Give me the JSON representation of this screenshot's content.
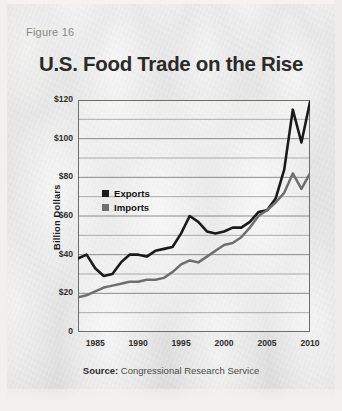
{
  "figure_label": "Figure 16",
  "title": "U.S. Food Trade on the Rise",
  "source": {
    "prefix": "Source:",
    "text": "Congressional Research Service"
  },
  "legend": {
    "items": [
      {
        "label": "Exports",
        "color": "#1a1a1a"
      },
      {
        "label": "Imports",
        "color": "#6e6e6e"
      }
    ]
  },
  "chart_data": {
    "type": "line",
    "title": "U.S. Food Trade on the Rise",
    "xlabel": "",
    "ylabel": "Billion Dollars",
    "xlim": [
      1983,
      2010
    ],
    "ylim": [
      0,
      120
    ],
    "ytick_labels": [
      "0",
      "$20",
      "$40",
      "$60",
      "$80",
      "$100",
      "$120"
    ],
    "yticks": [
      0,
      20,
      40,
      60,
      80,
      100,
      120
    ],
    "minor_ytick_step": 10,
    "xticks": [
      1985,
      1990,
      1995,
      2000,
      2005,
      2010
    ],
    "xtick_labels": [
      "1985",
      "1990",
      "1995",
      "2000",
      "2005",
      "2010"
    ],
    "grid": "horizontal",
    "legend_position": "inside-upper-left",
    "x": [
      1983,
      1984,
      1985,
      1986,
      1987,
      1988,
      1989,
      1990,
      1991,
      1992,
      1993,
      1994,
      1995,
      1996,
      1997,
      1998,
      1999,
      2000,
      2001,
      2002,
      2003,
      2004,
      2005,
      2006,
      2007,
      2008,
      2009,
      2010
    ],
    "series": [
      {
        "name": "Exports",
        "color": "#1a1a1a",
        "values": [
          38,
          40,
          33,
          29,
          30,
          36,
          40,
          40,
          39,
          42,
          43,
          44,
          51,
          60,
          57,
          52,
          51,
          52,
          54,
          54,
          57,
          62,
          63,
          69,
          84,
          115,
          98,
          119
        ]
      },
      {
        "name": "Imports",
        "color": "#6e6e6e",
        "values": [
          18,
          19,
          21,
          23,
          24,
          25,
          26,
          26,
          27,
          27,
          28,
          31,
          35,
          37,
          36,
          39,
          42,
          45,
          46,
          49,
          54,
          60,
          63,
          67,
          72,
          82,
          74,
          82
        ]
      }
    ]
  }
}
